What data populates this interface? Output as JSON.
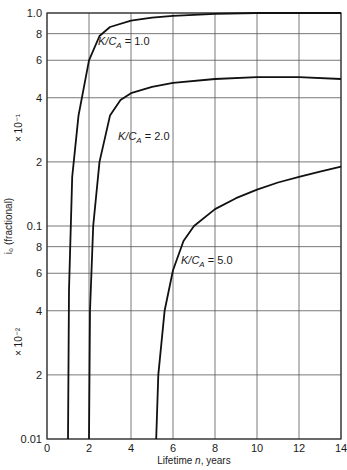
{
  "chart_data": {
    "type": "line",
    "title": "",
    "xlabel": "Lifetime n, years",
    "ylabel": "i0 (fractional)",
    "xscale": "linear",
    "yscale": "log",
    "xlim": [
      0,
      14
    ],
    "ylim": [
      0.01,
      1.0
    ],
    "grid": true,
    "legend": "none (inline curve labels)",
    "x_ticks": [
      "0",
      "2",
      "4",
      "6",
      "8",
      "10",
      "12",
      "14"
    ],
    "y_ticks": [
      "0.01",
      "2",
      "4",
      "6",
      "8",
      "0.1",
      "2",
      "4",
      "6",
      "8",
      "1.0"
    ],
    "y_ticks_values": [
      0.01,
      0.02,
      0.04,
      0.06,
      0.08,
      0.1,
      0.2,
      0.4,
      0.6,
      0.8,
      1.0
    ],
    "y_multiplier_labels": [
      "× 10⁻¹",
      "× 10⁻²"
    ],
    "series": [
      {
        "name": "K/C_A = 1.0",
        "x": [
          1.0,
          1.05,
          1.2,
          1.5,
          2.0,
          2.5,
          3.0,
          4.0,
          5.0,
          6.0,
          8.0,
          10.0,
          12.0,
          14.0
        ],
        "values": [
          0.01,
          0.05,
          0.17,
          0.33,
          0.6,
          0.78,
          0.86,
          0.92,
          0.95,
          0.97,
          0.99,
          1.0,
          1.0,
          1.0
        ]
      },
      {
        "name": "K/C_A = 2.0",
        "x": [
          2.0,
          2.05,
          2.2,
          2.5,
          3.0,
          3.5,
          4.0,
          5.0,
          6.0,
          8.0,
          10.0,
          12.0,
          14.0
        ],
        "values": [
          0.01,
          0.04,
          0.1,
          0.2,
          0.33,
          0.39,
          0.42,
          0.45,
          0.47,
          0.49,
          0.5,
          0.5,
          0.49
        ]
      },
      {
        "name": "K/C_A = 5.0",
        "x": [
          5.2,
          5.3,
          5.6,
          6.0,
          6.5,
          7.0,
          8.0,
          9.0,
          10.0,
          11.0,
          12.0,
          13.0,
          14.0
        ],
        "values": [
          0.01,
          0.02,
          0.04,
          0.062,
          0.085,
          0.1,
          0.12,
          0.135,
          0.148,
          0.16,
          0.17,
          0.18,
          0.19
        ]
      }
    ],
    "annotations": [
      {
        "text": "K/C_A = 1.0",
        "x": 2.3,
        "y": 0.75
      },
      {
        "text": "K/C_A = 2.0",
        "x": 3.3,
        "y": 0.27
      },
      {
        "text": "K/C_A = 5.0",
        "x": 6.0,
        "y": 0.067
      }
    ]
  },
  "labels": {
    "xlabel_pre": "Lifetime ",
    "xlabel_var": "n",
    "xlabel_post": ", years",
    "ylabel": "i₀ (fractional)",
    "mult_upper": "× 10⁻¹",
    "mult_lower": "× 10⁻²",
    "curve1": {
      "pre": "K/C",
      "sub": "A",
      "post": " = 1.0"
    },
    "curve2": {
      "pre": "K/C",
      "sub": "A",
      "post": " = 2.0"
    },
    "curve3": {
      "pre": "K/C",
      "sub": "A",
      "post": " = 5.0"
    }
  },
  "colors": {
    "grid": "#555555",
    "curve": "#111111",
    "text": "#1a1a1a",
    "background": "#ffffff"
  }
}
